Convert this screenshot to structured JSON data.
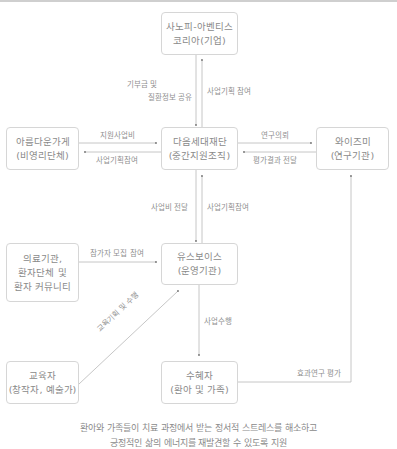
{
  "nodes": {
    "sanofi": {
      "line1": "사노피-아벤티스",
      "line2": "코리아(기업)"
    },
    "areumdaun": {
      "line1": "아름다운가게",
      "line2": "(비영리단체)"
    },
    "foundation": {
      "line1": "다음세대재단",
      "line2": "(중간지원조직)"
    },
    "wisemi": {
      "line1": "와이즈미",
      "line2": "(연구기관)"
    },
    "medical": {
      "line1": "의료기관,",
      "line2": "환자단체 및",
      "line3": "환자 커뮤니티"
    },
    "youthvoice": {
      "line1": "유스보이스",
      "line2": "(운영기관)"
    },
    "educator": {
      "line1": "교육자",
      "line2": "(창작자, 예술가)"
    },
    "beneficiary": {
      "line1": "수혜자",
      "line2": "(환아 및 가족)"
    }
  },
  "edges": {
    "sanofi_to_foundation_1": "기부금 및",
    "sanofi_to_foundation_2": "질환정보 공유",
    "foundation_to_sanofi": "사업기획 참여",
    "areum_to_foundation": "지원사업비",
    "foundation_to_areum": "사업기획참여",
    "foundation_to_wisemi": "연구의뢰",
    "wisemi_to_foundation": "평가결과 전달",
    "foundation_to_youth": "사업비 전달",
    "youth_to_foundation": "사업기획참여",
    "medical_to_youth": "참가자 모집 참여",
    "educator_to_youth": "교육기획 및 수행",
    "youth_to_beneficiary": "사업수행",
    "beneficiary_to_wisemi": "효과연구 평가"
  },
  "caption": {
    "line1": "환아와 가족들이 치료 과정에서 받는 정서적 스트레스를 해소하고",
    "line2": "긍정적인 삶의 에너지를 재발견할 수 있도록 지원"
  },
  "colors": {
    "line": "#b5b5b5",
    "border": "#d6d6d6",
    "text": "#8a8a8a"
  }
}
